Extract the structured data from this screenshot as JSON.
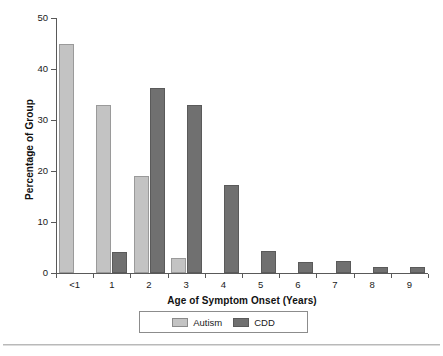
{
  "figure": {
    "background_color": "#ffffff"
  },
  "chart_data": {
    "type": "bar",
    "title": "",
    "xlabel": "Age of Symptom Onset (Years)",
    "ylabel": "Percentage of Group",
    "categories": [
      "<1",
      "1",
      "2",
      "3",
      "4",
      "5",
      "6",
      "7",
      "8",
      "9"
    ],
    "ylim": [
      0,
      50
    ],
    "yticks": [
      0,
      10,
      20,
      30,
      40,
      50
    ],
    "ytick_labels": [
      "0",
      "10",
      "20",
      "30",
      "40",
      "50"
    ],
    "grid": false,
    "legend_position": "bottom-center",
    "series": [
      {
        "name": "Autism",
        "color": "#c3c3c3",
        "edge_color": "#9a9a9a",
        "values": [
          45.0,
          33.0,
          19.0,
          3.0,
          0,
          0,
          0,
          0,
          0,
          0
        ]
      },
      {
        "name": "CDD",
        "color": "#707070",
        "edge_color": "#5a5a5a",
        "values": [
          0,
          4.2,
          36.3,
          33.0,
          17.3,
          4.3,
          2.2,
          2.3,
          1.2,
          1.2
        ]
      }
    ]
  },
  "legend": {
    "entries": [
      {
        "label": "Autism",
        "color": "#c3c3c3"
      },
      {
        "label": "CDD",
        "color": "#707070"
      }
    ]
  },
  "axes": {
    "y_title": "Percentage of Group",
    "x_title": "Age of Symptom Onset (Years)"
  }
}
